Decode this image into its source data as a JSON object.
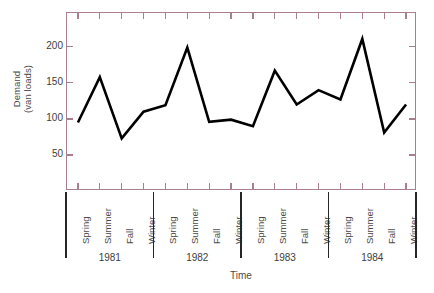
{
  "chart_data": {
    "type": "line",
    "title": "",
    "xlabel": "Time",
    "ylabel": "Demand (van loads)",
    "ylabel_line1": "Demand",
    "ylabel_line2": "(van loads)",
    "ylim": [
      0,
      247
    ],
    "yticks": [
      50,
      100,
      150,
      200
    ],
    "ytick_labels": [
      "50",
      "100",
      "150",
      "200"
    ],
    "grid": false,
    "legend": null,
    "series_color": "#000000",
    "axis_color": "#a8808c",
    "categories": [
      "Spring",
      "Summer",
      "Fall",
      "Winter",
      "Spring",
      "Summer",
      "Fall",
      "Winter",
      "Spring",
      "Summer",
      "Fall",
      "Winter",
      "Spring",
      "Summer",
      "Fall",
      "Winter"
    ],
    "values": [
      95,
      158,
      73,
      110,
      119,
      199,
      96,
      99,
      90,
      167,
      120,
      140,
      127,
      211,
      81,
      120
    ],
    "groups": [
      {
        "label": "1981",
        "count": 4
      },
      {
        "label": "1982",
        "count": 4
      },
      {
        "label": "1983",
        "count": 4
      },
      {
        "label": "1984",
        "count": 4
      }
    ],
    "points": [
      {
        "season": "Spring",
        "year": "1981",
        "value": 95
      },
      {
        "season": "Summer",
        "year": "1981",
        "value": 158
      },
      {
        "season": "Fall",
        "year": "1981",
        "value": 73
      },
      {
        "season": "Winter",
        "year": "1981",
        "value": 110
      },
      {
        "season": "Spring",
        "year": "1982",
        "value": 119
      },
      {
        "season": "Summer",
        "year": "1982",
        "value": 199
      },
      {
        "season": "Fall",
        "year": "1982",
        "value": 96
      },
      {
        "season": "Winter",
        "year": "1982",
        "value": 99
      },
      {
        "season": "Spring",
        "year": "1983",
        "value": 90
      },
      {
        "season": "Summer",
        "year": "1983",
        "value": 167
      },
      {
        "season": "Fall",
        "year": "1983",
        "value": 120
      },
      {
        "season": "Winter",
        "year": "1983",
        "value": 140
      },
      {
        "season": "Spring",
        "year": "1984",
        "value": 127
      },
      {
        "season": "Summer",
        "year": "1984",
        "value": 211
      },
      {
        "season": "Fall",
        "year": "1984",
        "value": 81
      },
      {
        "season": "Winter",
        "year": "1984",
        "value": 120
      }
    ]
  }
}
